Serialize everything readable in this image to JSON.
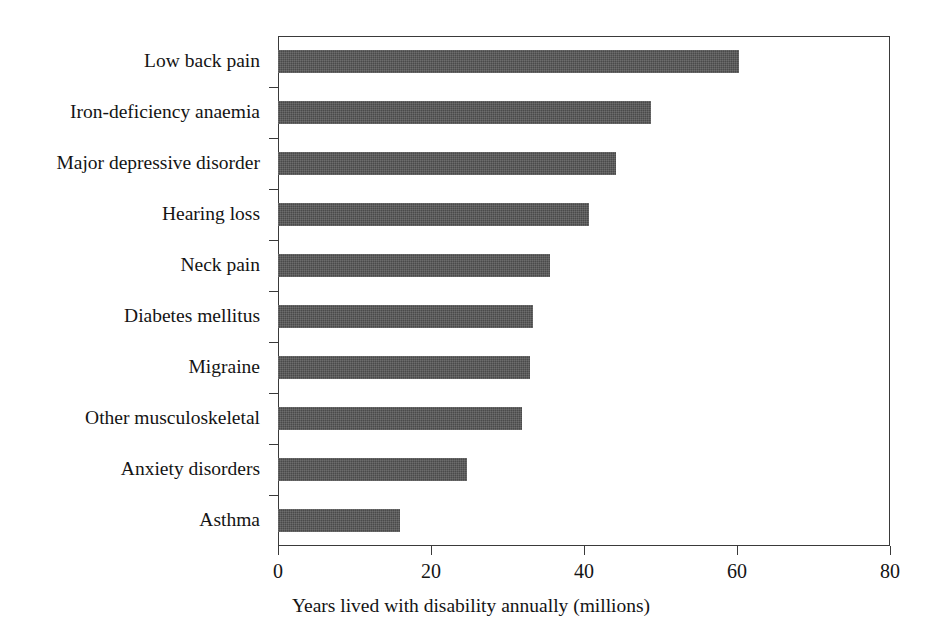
{
  "chart_data": {
    "type": "bar",
    "orientation": "horizontal",
    "title": "",
    "subtitle": "",
    "xlabel": "Years lived with disability annually (millions)",
    "ylabel": "",
    "xlim": [
      0,
      80
    ],
    "xticks": [
      0,
      20,
      40,
      60,
      80
    ],
    "xtick_labels": [
      "0",
      "20",
      "40",
      "60",
      "80"
    ],
    "grid": false,
    "legend": null,
    "bar_color": "#4a4a4a",
    "axis_color": "#3a3a3a",
    "background_color": "#ffffff",
    "categories": [
      "Low back pain",
      "Iron-deficiency anaemia",
      "Major depressive disorder",
      "Hearing loss",
      "Neck pain",
      "Diabetes mellitus",
      "Migraine",
      "Other musculoskeletal",
      "Anxiety disorders",
      "Asthma"
    ],
    "values": [
      60.3,
      48.8,
      44.2,
      40.7,
      35.5,
      33.3,
      33.0,
      31.9,
      24.7,
      16.0
    ],
    "units": "millions"
  }
}
